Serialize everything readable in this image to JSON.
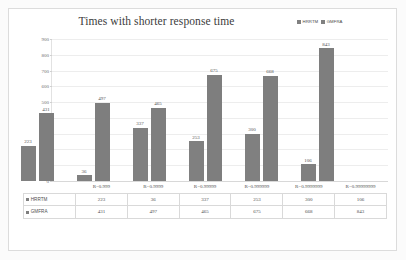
{
  "chart_data": {
    "type": "bar",
    "title": "Times with shorter response time",
    "xlabel": "",
    "ylabel": "",
    "ylim": [
      0,
      900
    ],
    "yticks": [
      0,
      100,
      200,
      300,
      400,
      500,
      600,
      700,
      800,
      900
    ],
    "grid": true,
    "legend_position": "top-right",
    "categories": [
      "R=0.999",
      "R=0.9999",
      "R=0.99999",
      "R=0.999999",
      "R=0.9999999",
      "R=0.99999999"
    ],
    "series": [
      {
        "name": "HRRTM",
        "color": "#808080",
        "values": [
          223,
          36,
          337,
          253,
          300,
          106
        ]
      },
      {
        "name": "GMFRA",
        "color": "#7e7e7e",
        "values": [
          431,
          497,
          465,
          675,
          668,
          843
        ]
      }
    ]
  },
  "legend": {
    "items": [
      {
        "label": "HRRTM"
      },
      {
        "label": "GMFRA"
      }
    ]
  },
  "table": {
    "row_headers": [
      "HRRTM",
      "GMFRA"
    ]
  }
}
